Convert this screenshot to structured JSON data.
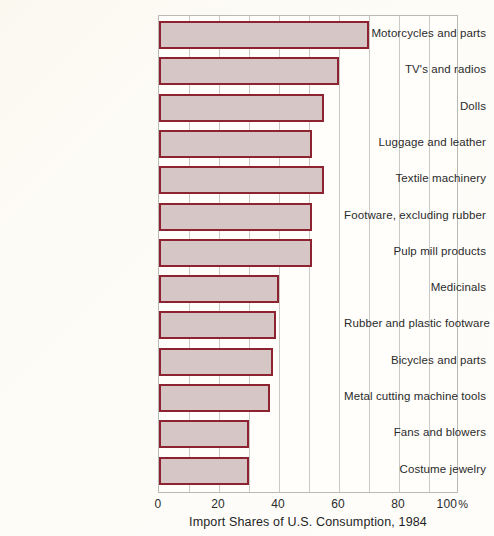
{
  "chart_data": {
    "type": "bar",
    "orientation": "horizontal",
    "title": "",
    "xlabel": "Import Shares of U.S. Consumption, 1984",
    "ylabel": "",
    "xlim": [
      0,
      100
    ],
    "xticks": [
      0,
      20,
      40,
      60,
      80,
      100
    ],
    "xtick_labels": [
      "0",
      "20",
      "40",
      "60",
      "80",
      "100"
    ],
    "xtick_suffix": "%",
    "grid": true,
    "grid_axis": "x",
    "grid_interval": 10,
    "legend": null,
    "categories": [
      "Motorcycles and parts",
      "TV's and radios",
      "Dolls",
      "Luggage and leather",
      "Textile machinery",
      "Footware, excluding rubber",
      "Pulp mill products",
      "Medicinals",
      "Rubber and plastic footware",
      "Bicycles and parts",
      "Metal cutting machine tools",
      "Fans and blowers",
      "Costume jewelry"
    ],
    "values": [
      70,
      60,
      55,
      51,
      55,
      51,
      51,
      40,
      39,
      38,
      37,
      30,
      30
    ],
    "bar_fill_color": "#d6c6c6",
    "bar_border_color": "#8d2231",
    "background_color": "#fdfbf5",
    "grid_color": "#c9c9c5"
  },
  "axis": {
    "title": "Import Shares of U.S. Consumption, 1984",
    "percent_symbol": "%"
  }
}
